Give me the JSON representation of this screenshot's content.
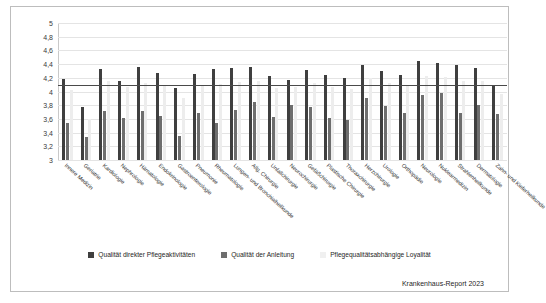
{
  "chart_data": {
    "type": "bar",
    "title": "",
    "subtitle": "",
    "xlabel": "",
    "ylabel": "",
    "ylim": [
      3,
      5
    ],
    "yticks": [
      "3",
      "3,2",
      "3,4",
      "3,6",
      "3,8",
      "4",
      "4,2",
      "4,4",
      "4,6",
      "4,8",
      "5"
    ],
    "ytick_values": [
      3,
      3.2,
      3.4,
      3.6,
      3.8,
      4,
      4.2,
      4.4,
      4.6,
      4.8,
      5
    ],
    "grid": true,
    "legend_position": "bottom",
    "reference_line": 4.1,
    "categories": [
      "Innere Medizin",
      "Geriatrie",
      "Kardiologie",
      "Nephrologie",
      "Hämatologie",
      "Endokrinologie",
      "Gastroenterologie",
      "Pneumonie",
      "Rheumatologie",
      "Lungen- und Bronchialheilkunde",
      "Allg. Chirurgie",
      "Unfallchirurgie",
      "Neurochirurgie",
      "Gefäßchirurgie",
      "Plastische Chirurgie",
      "Thoraxchirurgie",
      "Herzchirurgie",
      "Urologie",
      "Orthopädie",
      "Neurologie",
      "Nuklearmedizin",
      "Strahlenheilkunde",
      "Dermatologie",
      "Zahn- und Kieferheilkunde"
    ],
    "series": [
      {
        "name": "Qualität direkter Pflegeaktivitäten",
        "color": "#3f3f3f",
        "values": [
          4.19,
          3.77,
          4.33,
          4.16,
          4.36,
          4.27,
          4.05,
          4.26,
          4.33,
          4.35,
          4.36,
          4.23,
          4.17,
          4.31,
          4.24,
          4.2,
          4.39,
          4.3,
          4.24,
          4.44,
          4.42,
          4.38,
          4.35,
          4.1
        ]
      },
      {
        "name": "Qualität der Anleitung",
        "color": "#6e6e6e",
        "values": [
          3.54,
          3.33,
          3.71,
          3.61,
          3.71,
          3.64,
          3.35,
          3.69,
          3.54,
          3.73,
          3.85,
          3.63,
          3.8,
          3.77,
          3.62,
          3.58,
          3.9,
          3.79,
          3.69,
          3.95,
          3.98,
          3.68,
          3.8,
          3.67
        ]
      },
      {
        "name": "Pflegequalitätsabhängige Loyalität",
        "color": "#ededed",
        "values": [
          4.02,
          3.6,
          4.15,
          4.07,
          4.13,
          4.1,
          3.9,
          4.09,
          4.11,
          4.14,
          4.16,
          4.05,
          4.06,
          4.13,
          4.06,
          4.04,
          4.2,
          4.13,
          4.08,
          4.22,
          4.21,
          4.16,
          4.15,
          3.96
        ]
      }
    ]
  },
  "legend": {
    "items": [
      {
        "label": "Qualität direkter Pflegeaktivitäten"
      },
      {
        "label": "Qualität der Anleitung"
      },
      {
        "label": "Pflegequalitätsabhängige Loyalität"
      }
    ]
  },
  "source_note": "Krankenhaus-Report 2023"
}
